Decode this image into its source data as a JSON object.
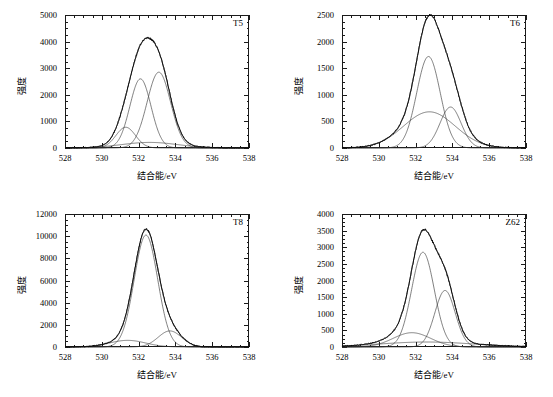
{
  "figure": {
    "panel_count": 4,
    "axis_titles": {
      "x": "结合能/eV",
      "y": "强度"
    }
  },
  "chart_data": [
    {
      "type": "line",
      "title": "T5",
      "xlabel": "结合能/eV",
      "ylabel": "强度",
      "xlim": [
        528,
        538
      ],
      "ylim": [
        0,
        5000
      ],
      "xticks": [
        528,
        530,
        532,
        534,
        536,
        538
      ],
      "yticks": [
        0,
        1000,
        2000,
        3000,
        4000,
        5000
      ],
      "xminor_step": 0.5,
      "yminor_step": 250,
      "grid": false,
      "legend": "none",
      "series": [
        {
          "name": "raw-data",
          "style": "noisy",
          "peak_x": 532.35,
          "peak_y": 4750
        },
        {
          "name": "envelope-fit",
          "style": "smooth",
          "peak_x": 532.35,
          "peak_y": 4730,
          "components_sum": true
        },
        {
          "name": "component-1",
          "style": "gaussian",
          "center": 531.3,
          "amplitude": 780,
          "fwhm": 1.25
        },
        {
          "name": "component-2",
          "style": "gaussian",
          "center": 532.1,
          "amplitude": 2600,
          "fwhm": 1.35
        },
        {
          "name": "component-3",
          "style": "gaussian",
          "center": 533.1,
          "amplitude": 2850,
          "fwhm": 1.5
        },
        {
          "name": "component-4",
          "style": "gaussian",
          "center": 532.6,
          "amplitude": 210,
          "fwhm": 3.6
        }
      ]
    },
    {
      "type": "line",
      "title": "T6",
      "xlabel": "结合能/eV",
      "ylabel": "强度",
      "xlim": [
        528,
        538
      ],
      "ylim": [
        0,
        2500
      ],
      "xticks": [
        528,
        530,
        532,
        534,
        536,
        538
      ],
      "yticks": [
        0,
        500,
        1000,
        1500,
        2000,
        2500
      ],
      "xminor_step": 0.5,
      "yminor_step": 125,
      "grid": false,
      "legend": "none",
      "series": [
        {
          "name": "raw-data",
          "style": "noisy",
          "peak_x": 532.8,
          "peak_y": 2530
        },
        {
          "name": "envelope-fit",
          "style": "smooth",
          "peak_x": 532.8,
          "peak_y": 2520,
          "components_sum": true
        },
        {
          "name": "component-1",
          "style": "gaussian",
          "center": 532.7,
          "amplitude": 1720,
          "fwhm": 1.5
        },
        {
          "name": "component-2",
          "style": "gaussian",
          "center": 533.9,
          "amplitude": 770,
          "fwhm": 1.35
        },
        {
          "name": "component-3",
          "style": "gaussian",
          "center": 532.75,
          "amplitude": 680,
          "fwhm": 3.3
        }
      ]
    },
    {
      "type": "line",
      "title": "T8",
      "xlabel": "结合能/eV",
      "ylabel": "强度",
      "xlim": [
        528,
        538
      ],
      "ylim": [
        0,
        12000
      ],
      "xticks": [
        528,
        530,
        532,
        534,
        536,
        538
      ],
      "yticks": [
        0,
        2000,
        4000,
        6000,
        8000,
        10000,
        12000
      ],
      "xminor_step": 0.5,
      "yminor_step": 500,
      "grid": false,
      "legend": "none",
      "series": [
        {
          "name": "raw-data",
          "style": "noisy",
          "peak_x": 532.45,
          "peak_y": 10900
        },
        {
          "name": "envelope-fit",
          "style": "smooth",
          "peak_x": 532.45,
          "peak_y": 10850,
          "components_sum": true
        },
        {
          "name": "component-1",
          "style": "gaussian",
          "center": 532.4,
          "amplitude": 10100,
          "fwhm": 1.5
        },
        {
          "name": "component-2",
          "style": "gaussian",
          "center": 533.7,
          "amplitude": 1450,
          "fwhm": 1.5
        },
        {
          "name": "component-3",
          "style": "gaussian",
          "center": 531.4,
          "amplitude": 600,
          "fwhm": 2.3
        }
      ]
    },
    {
      "type": "line",
      "title": "Z62",
      "xlabel": "结合能/eV",
      "ylabel": "强度",
      "xlim": [
        528,
        538
      ],
      "ylim": [
        0,
        4000
      ],
      "xticks": [
        528,
        530,
        532,
        534,
        536,
        538
      ],
      "yticks": [
        0,
        500,
        1000,
        1500,
        2000,
        2500,
        3000,
        3500,
        4000
      ],
      "xminor_step": 0.5,
      "yminor_step": 125,
      "grid": false,
      "legend": "none",
      "series": [
        {
          "name": "raw-data",
          "style": "noisy",
          "peak_x": 532.5,
          "peak_y": 3770
        },
        {
          "name": "envelope-fit",
          "style": "smooth",
          "peak_x": 532.5,
          "peak_y": 3750,
          "components_sum": true
        },
        {
          "name": "component-1",
          "style": "gaussian",
          "center": 532.4,
          "amplitude": 2850,
          "fwhm": 1.45
        },
        {
          "name": "component-2",
          "style": "gaussian",
          "center": 533.6,
          "amplitude": 1700,
          "fwhm": 1.3
        },
        {
          "name": "component-3",
          "style": "gaussian",
          "center": 531.8,
          "amplitude": 430,
          "fwhm": 2.4
        },
        {
          "name": "component-4",
          "style": "baseline",
          "center": 532.6,
          "amplitude": 150,
          "fwhm": 6.0
        }
      ]
    }
  ]
}
